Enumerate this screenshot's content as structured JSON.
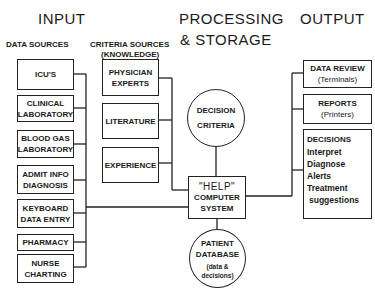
{
  "headers": {
    "input": "INPUT",
    "processing_line1": "PROCESSING",
    "processing_line2": "& STORAGE",
    "output": "OUTPUT"
  },
  "subheaders": {
    "data_sources": "DATA SOURCES",
    "criteria_sources_line1": "CRITERIA SOURCES",
    "criteria_sources_line2": "(KNOWLEDGE)"
  },
  "data_sources": [
    {
      "line1": "ICU'S",
      "line2": ""
    },
    {
      "line1": "CLINICAL",
      "line2": "LABORATORY"
    },
    {
      "line1": "BLOOD GAS",
      "line2": "LABORATORY"
    },
    {
      "line1": "ADMIT INFO",
      "line2": "DIAGNOSIS"
    },
    {
      "line1": "KEYBOARD",
      "line2": "DATA ENTRY"
    },
    {
      "line1": "PHARMACY",
      "line2": ""
    },
    {
      "line1": "NURSE",
      "line2": "CHARTING"
    }
  ],
  "criteria_sources": [
    {
      "line1": "PHYSICIAN",
      "line2": "EXPERTS"
    },
    {
      "line1": "LITERATURE",
      "line2": ""
    },
    {
      "line1": "EXPERIENCE",
      "line2": ""
    }
  ],
  "processing": {
    "decision_criteria": {
      "line1": "DECISION",
      "line2": "CRITERIA"
    },
    "help_system": {
      "line1": "\"HELP\"",
      "line2": "COMPUTER",
      "line3": "SYSTEM"
    },
    "patient_database": {
      "line1": "PATIENT",
      "line2": "DATABASE",
      "line3": "(data &",
      "line4": "decisions)"
    }
  },
  "outputs": {
    "data_review": {
      "line1": "DATA REVIEW",
      "line2": "(Terminals)"
    },
    "reports": {
      "line1": "REPORTS",
      "line2": "(Printers)"
    },
    "decisions": {
      "title": "DECISIONS",
      "items": [
        "Interpret",
        "Diagnose",
        "Alerts",
        "Treatment",
        "suggestions"
      ]
    }
  }
}
